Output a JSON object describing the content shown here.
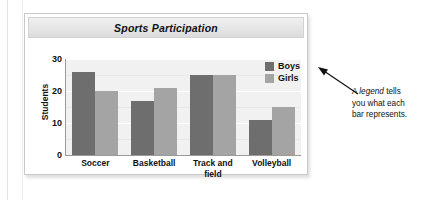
{
  "chart_data": {
    "type": "bar",
    "title": "Sports Participation",
    "xlabel": "",
    "ylabel": "Students",
    "ylim": [
      0,
      30
    ],
    "yticks": [
      30,
      20,
      10,
      0
    ],
    "grid": true,
    "legend_position": "top-right",
    "categories": [
      "Soccer",
      "Basketball",
      "Track and field",
      "Volleyball"
    ],
    "category_lines": [
      [
        "Soccer"
      ],
      [
        "Basketball"
      ],
      [
        "Track and",
        "field"
      ],
      [
        "Volleyball"
      ]
    ],
    "series": [
      {
        "name": "Boys",
        "color": "#6e6e6e",
        "values": [
          26,
          17,
          25,
          11
        ]
      },
      {
        "name": "Girls",
        "color": "#a4a4a4",
        "values": [
          20,
          21,
          25,
          15
        ]
      }
    ]
  },
  "annotation": {
    "lines": [
      "A ",
      "legend",
      " tells"
    ],
    "line1_pre": "A ",
    "line1_em": "legend",
    "line1_post": " tells",
    "line2": "you what each",
    "line3": "bar represents."
  },
  "colors": {
    "boys": "#6e6e6e",
    "girls": "#a4a4a4",
    "plot_background": "#f1f1f1",
    "gridline": "#ffffff",
    "axis": "#9a9a9a",
    "title_bar": "#e6e6e6",
    "card_border": "#c9c9c9",
    "text": "#111111"
  }
}
